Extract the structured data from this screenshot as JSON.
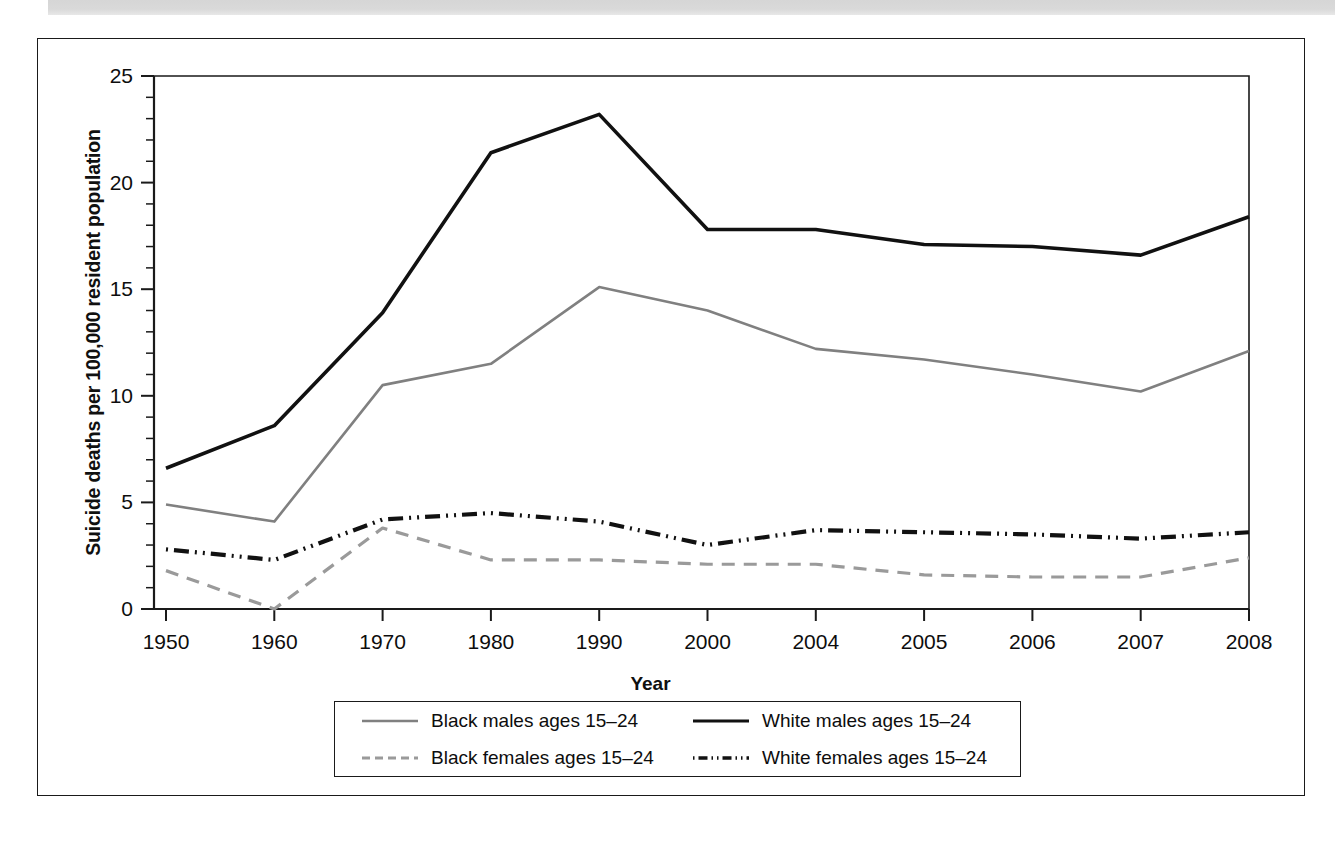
{
  "figure": {
    "top_band": "decorative-gray-band"
  },
  "chart_data": {
    "type": "line",
    "title": "",
    "xlabel": "Year",
    "ylabel": "Suicide deaths per 100,000 resident population",
    "categories": [
      "1950",
      "1960",
      "1970",
      "1980",
      "1990",
      "2000",
      "2004",
      "2005",
      "2006",
      "2007",
      "2008"
    ],
    "ylim": [
      0,
      25
    ],
    "yticks": [
      0,
      5,
      10,
      15,
      20,
      25
    ],
    "ytick_labels": [
      "0",
      "5",
      "10",
      "15",
      "20",
      "25"
    ],
    "minor_tick_step": 1,
    "grid": false,
    "legend_position": "below-plot",
    "series": [
      {
        "name": "Black males ages 15–24",
        "color": "#808080",
        "style": "solid",
        "values": [
          4.9,
          4.1,
          10.5,
          11.5,
          15.1,
          14.0,
          12.2,
          11.7,
          11.0,
          10.2,
          12.1
        ]
      },
      {
        "name": "White males ages 15–24",
        "color": "#111111",
        "style": "solid",
        "values": [
          6.6,
          8.6,
          13.9,
          21.4,
          23.2,
          17.8,
          17.8,
          17.1,
          17.0,
          16.6,
          18.4
        ]
      },
      {
        "name": "Black females ages 15–24",
        "color": "#9a9a9a",
        "style": "dashed",
        "values": [
          1.8,
          0.0,
          3.8,
          2.3,
          2.3,
          2.1,
          2.1,
          1.6,
          1.5,
          1.5,
          2.4
        ]
      },
      {
        "name": "White females ages 15–24",
        "color": "#111111",
        "style": "dashdot",
        "values": [
          2.8,
          2.3,
          4.2,
          4.5,
          4.1,
          3.0,
          3.7,
          3.6,
          3.5,
          3.3,
          3.6
        ]
      }
    ]
  },
  "legend": {
    "entries": [
      {
        "label": "Black males ages 15–24"
      },
      {
        "label": "White males ages 15–24"
      },
      {
        "label": "Black females ages 15–24"
      },
      {
        "label": "White females ages 15–24"
      }
    ]
  }
}
